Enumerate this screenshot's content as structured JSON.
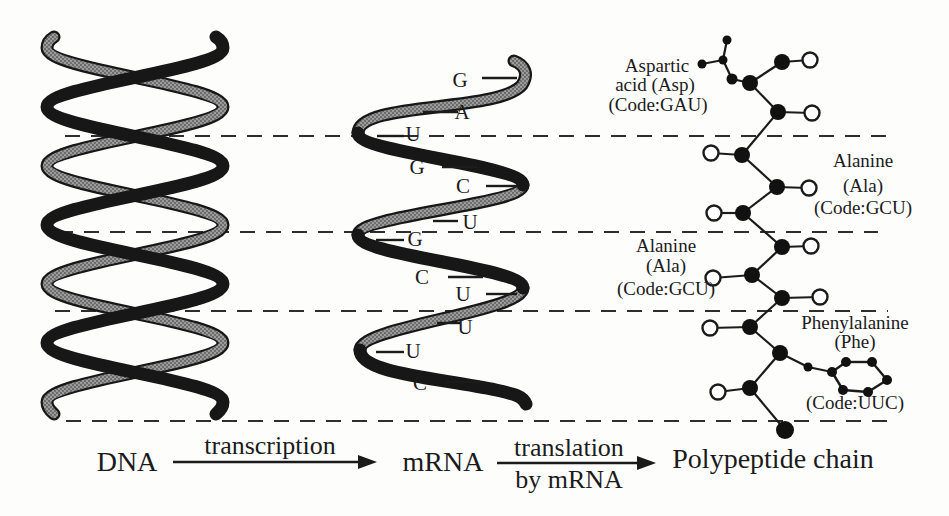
{
  "colors": {
    "ink": "#1b1b1b",
    "gray_ribbon": "#9b9b9b",
    "background": "#fdfdfc"
  },
  "dna": {
    "label": "DNA"
  },
  "mrna": {
    "label": "mRNA",
    "bases": [
      "G",
      "A",
      "U",
      "G",
      "C",
      "U",
      "G",
      "C",
      "U",
      "U",
      "U",
      "C"
    ]
  },
  "polypeptide": {
    "label": "Polypeptide chain"
  },
  "process": {
    "transcription": "transcription",
    "translation_top": "translation",
    "translation_bottom": "by mRNA"
  },
  "amino_acids": [
    {
      "line1": "Aspartic",
      "line2": "acid (Asp)",
      "code": "(Code:GAU)"
    },
    {
      "line1": "Alanine",
      "line2": "(Ala)",
      "code": "(Code:GCU)"
    },
    {
      "line1": "Alanine",
      "line2": "(Ala)",
      "code": "(Code:GCU)"
    },
    {
      "line1": "Phenylalanine",
      "line2": "(Phe)",
      "code": "(Code:UUC)"
    }
  ]
}
